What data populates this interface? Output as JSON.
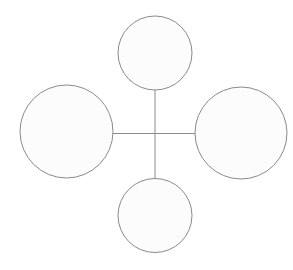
{
  "canvas": {
    "width": 293,
    "height": 270,
    "background_color": "#ffffff"
  },
  "diagram": {
    "stroke_color": "#8a8a8a",
    "stroke_width": 1,
    "node_fill_color": "#fcfcfc",
    "nodes": [
      {
        "id": "top",
        "cx": 155,
        "cy": 53,
        "r": 37
      },
      {
        "id": "left",
        "cx": 66.5,
        "cy": 131.5,
        "r": 46.5
      },
      {
        "id": "right",
        "cx": 241,
        "cy": 133,
        "r": 46
      },
      {
        "id": "bottom",
        "cx": 155,
        "cy": 215.5,
        "r": 37
      }
    ],
    "edges": [
      {
        "id": "vertical",
        "x1": 155,
        "y1": 90,
        "x2": 155,
        "y2": 178.5
      },
      {
        "id": "horizontal",
        "x1": 113,
        "y1": 133.5,
        "x2": 195,
        "y2": 133.5
      }
    ]
  }
}
